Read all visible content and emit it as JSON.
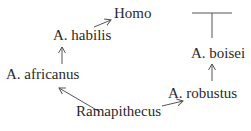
{
  "diagram": {
    "type": "phylogenetic-tree",
    "nodes": [
      {
        "id": "homo",
        "label": "Homo"
      },
      {
        "id": "habilis",
        "label": "A. habilis"
      },
      {
        "id": "africanus",
        "label": "A. africanus"
      },
      {
        "id": "ramapithecus",
        "label": "Ramapithecus"
      },
      {
        "id": "robustus",
        "label": "A. robustus"
      },
      {
        "id": "boisei",
        "label": "A. boisei"
      }
    ],
    "edges": [
      {
        "from": "ramapithecus",
        "to": "africanus"
      },
      {
        "from": "africanus",
        "to": "habilis"
      },
      {
        "from": "habilis",
        "to": "homo"
      },
      {
        "from": "ramapithecus",
        "to": "robustus"
      },
      {
        "from": "robustus",
        "to": "boisei"
      },
      {
        "from": "boisei",
        "to": "extinction-bar"
      }
    ],
    "terminator": "extinction-bar",
    "colors": {
      "ink": "#2a2a2a",
      "line": "#555555"
    }
  }
}
